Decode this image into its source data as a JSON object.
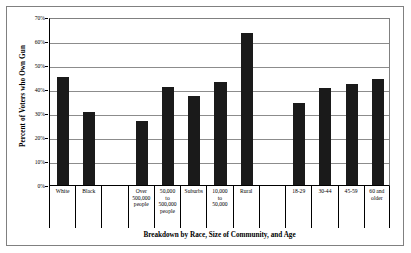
{
  "chart_data": {
    "type": "bar",
    "title": "",
    "xlabel": "Breakdown by Race, Size of Community, and Age",
    "ylabel": "Percent of Voters who Own Gun",
    "ylim": [
      0,
      70
    ],
    "ytick_labels": [
      "70%",
      "60%",
      "50%",
      "40%",
      "30%",
      "20%",
      "10%",
      "0%"
    ],
    "ytick_values": [
      70,
      60,
      50,
      40,
      30,
      20,
      10,
      0
    ],
    "grid": true,
    "legend": "none",
    "bar_color": "#1a1a1a",
    "categories": [
      "White",
      "Black",
      "",
      "Over\n500,000\npeople",
      "50,000\nto\n500,000\npeople",
      "Suburbs",
      "10,000\nto\n50,000",
      "Rural",
      "",
      "18-29",
      "30-44",
      "45-59",
      "60 and\nolder"
    ],
    "values": [
      45,
      30.5,
      null,
      26.5,
      41,
      37,
      43,
      63.5,
      null,
      34,
      40.5,
      42,
      44
    ],
    "groups": [
      {
        "name": "Race",
        "categories": [
          "White",
          "Black"
        ]
      },
      {
        "name": "Size of Community",
        "categories": [
          "Over 500,000 people",
          "50,000 to 500,000 people",
          "Suburbs",
          "10,000 to 50,000",
          "Rural"
        ]
      },
      {
        "name": "Age",
        "categories": [
          "18-29",
          "30-44",
          "45-59",
          "60 and older"
        ]
      }
    ]
  }
}
